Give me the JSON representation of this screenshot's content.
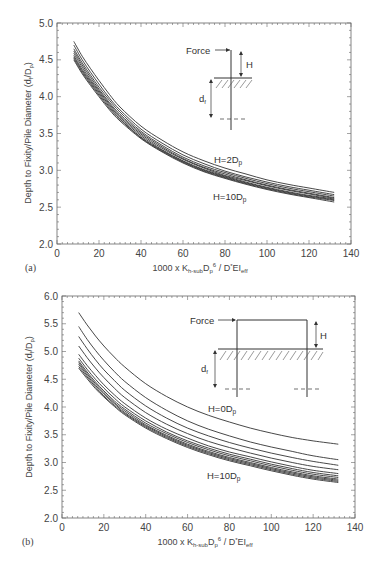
{
  "chart_data": [
    {
      "panel": "(a)",
      "type": "line",
      "title": "",
      "xlabel": "1000 x K_h-sub D_p^6 / D^* EI_eff",
      "ylabel": "Depth to Fixity/Pile Diameter (d_f/D_p)",
      "xlim": [
        0,
        140
      ],
      "ylim": [
        2.0,
        5.0
      ],
      "xticks": [
        0,
        20,
        40,
        60,
        80,
        100,
        120,
        140
      ],
      "yticks": [
        2.0,
        2.5,
        3.0,
        3.5,
        4.0,
        4.5,
        5.0
      ],
      "grid": false,
      "x": [
        8,
        12,
        16,
        20,
        25,
        30,
        40,
        50,
        60,
        70,
        80,
        90,
        100,
        110,
        120,
        132
      ],
      "series": [
        {
          "name": "H=2Dp",
          "values": [
            4.75,
            4.55,
            4.38,
            4.22,
            4.03,
            3.86,
            3.6,
            3.41,
            3.25,
            3.13,
            3.03,
            2.95,
            2.87,
            2.81,
            2.76,
            2.7
          ]
        },
        {
          "name": "H=3Dp",
          "values": [
            4.7,
            4.5,
            4.33,
            4.17,
            3.98,
            3.82,
            3.56,
            3.37,
            3.21,
            3.09,
            2.99,
            2.91,
            2.84,
            2.78,
            2.73,
            2.67
          ]
        },
        {
          "name": "H=4Dp",
          "values": [
            4.65,
            4.46,
            4.29,
            4.13,
            3.95,
            3.79,
            3.53,
            3.34,
            3.18,
            3.06,
            2.97,
            2.89,
            2.82,
            2.76,
            2.71,
            2.65
          ]
        },
        {
          "name": "H=5Dp",
          "values": [
            4.62,
            4.43,
            4.26,
            4.1,
            3.92,
            3.76,
            3.51,
            3.32,
            3.16,
            3.04,
            2.95,
            2.87,
            2.8,
            2.74,
            2.69,
            2.63
          ]
        },
        {
          "name": "H=6Dp",
          "values": [
            4.59,
            4.4,
            4.23,
            4.08,
            3.9,
            3.74,
            3.49,
            3.3,
            3.15,
            3.03,
            2.93,
            2.86,
            2.79,
            2.73,
            2.68,
            2.62
          ]
        },
        {
          "name": "H=7Dp",
          "values": [
            4.56,
            4.37,
            4.21,
            4.06,
            3.88,
            3.72,
            3.47,
            3.28,
            3.13,
            3.01,
            2.92,
            2.84,
            2.77,
            2.71,
            2.66,
            2.61
          ]
        },
        {
          "name": "H=8Dp",
          "values": [
            4.54,
            4.35,
            4.19,
            4.04,
            3.86,
            3.7,
            3.45,
            3.27,
            3.12,
            3.0,
            2.91,
            2.83,
            2.76,
            2.7,
            2.65,
            2.6
          ]
        },
        {
          "name": "H=9Dp",
          "values": [
            4.52,
            4.33,
            4.17,
            4.02,
            3.84,
            3.69,
            3.44,
            3.26,
            3.11,
            2.99,
            2.9,
            2.82,
            2.75,
            2.69,
            2.64,
            2.59
          ]
        },
        {
          "name": "H=10Dp",
          "values": [
            4.5,
            4.31,
            4.15,
            4.0,
            3.82,
            3.67,
            3.43,
            3.25,
            3.1,
            2.98,
            2.89,
            2.81,
            2.74,
            2.68,
            2.63,
            2.57
          ]
        }
      ],
      "annotations": [
        "H=2Dp",
        "H=10Dp",
        "Force",
        "H",
        "d_f"
      ]
    },
    {
      "panel": "(b)",
      "type": "line",
      "title": "",
      "xlabel": "1000 x K_h-sub D_p^6 / D^* EI_eff",
      "ylabel": "Depth to Fixity/Pile Diameter (d_f/D_p)",
      "xlim": [
        0,
        140
      ],
      "ylim": [
        2.0,
        6.0
      ],
      "xticks": [
        0,
        20,
        40,
        60,
        80,
        100,
        120,
        140
      ],
      "yticks": [
        2.0,
        2.5,
        3.0,
        3.5,
        4.0,
        4.5,
        5.0,
        5.5,
        6.0
      ],
      "grid": false,
      "x": [
        8,
        12,
        16,
        20,
        25,
        30,
        40,
        50,
        60,
        70,
        80,
        90,
        100,
        110,
        120,
        132
      ],
      "series": [
        {
          "name": "H=0Dp",
          "values": [
            5.7,
            5.48,
            5.28,
            5.1,
            4.9,
            4.72,
            4.42,
            4.19,
            4.0,
            3.85,
            3.73,
            3.62,
            3.53,
            3.45,
            3.39,
            3.33
          ]
        },
        {
          "name": "H=1Dp",
          "values": [
            5.45,
            5.22,
            5.02,
            4.84,
            4.64,
            4.46,
            4.17,
            3.94,
            3.75,
            3.6,
            3.48,
            3.37,
            3.28,
            3.2,
            3.12,
            3.05
          ]
        },
        {
          "name": "H=2Dp",
          "values": [
            5.27,
            5.05,
            4.85,
            4.67,
            4.48,
            4.3,
            4.02,
            3.8,
            3.62,
            3.48,
            3.36,
            3.26,
            3.17,
            3.09,
            3.02,
            2.95
          ]
        },
        {
          "name": "H=3Dp",
          "values": [
            5.1,
            4.89,
            4.7,
            4.53,
            4.34,
            4.17,
            3.9,
            3.69,
            3.52,
            3.38,
            3.27,
            3.17,
            3.08,
            3.0,
            2.93,
            2.87
          ]
        },
        {
          "name": "H=4Dp",
          "values": [
            4.95,
            4.75,
            4.57,
            4.4,
            4.22,
            4.06,
            3.8,
            3.6,
            3.44,
            3.3,
            3.19,
            3.1,
            3.01,
            2.93,
            2.86,
            2.8
          ]
        },
        {
          "name": "H=5Dp",
          "values": [
            4.88,
            4.68,
            4.5,
            4.34,
            4.16,
            4.0,
            3.75,
            3.55,
            3.39,
            3.26,
            3.15,
            3.06,
            2.97,
            2.89,
            2.82,
            2.76
          ]
        },
        {
          "name": "H=6Dp",
          "values": [
            4.83,
            4.63,
            4.45,
            4.29,
            4.11,
            3.96,
            3.71,
            3.52,
            3.36,
            3.23,
            3.12,
            3.03,
            2.94,
            2.86,
            2.79,
            2.73
          ]
        },
        {
          "name": "H=7Dp",
          "values": [
            4.8,
            4.6,
            4.42,
            4.26,
            4.08,
            3.93,
            3.68,
            3.49,
            3.33,
            3.2,
            3.09,
            3.0,
            2.91,
            2.83,
            2.76,
            2.7
          ]
        },
        {
          "name": "H=8Dp",
          "values": [
            4.77,
            4.57,
            4.39,
            4.23,
            4.06,
            3.9,
            3.66,
            3.47,
            3.31,
            3.18,
            3.07,
            2.98,
            2.89,
            2.81,
            2.74,
            2.68
          ]
        },
        {
          "name": "H=9Dp",
          "values": [
            4.73,
            4.54,
            4.36,
            4.2,
            4.03,
            3.88,
            3.64,
            3.45,
            3.29,
            3.16,
            3.05,
            2.96,
            2.87,
            2.79,
            2.72,
            2.66
          ]
        },
        {
          "name": "H=10Dp",
          "values": [
            4.7,
            4.51,
            4.33,
            4.18,
            4.01,
            3.86,
            3.62,
            3.43,
            3.27,
            3.14,
            3.03,
            2.94,
            2.85,
            2.77,
            2.7,
            2.64
          ]
        }
      ],
      "annotations": [
        "H=0Dp",
        "H=10Dp",
        "Force",
        "H",
        "d_f"
      ]
    }
  ],
  "panels": {
    "a": {
      "label": "(a)",
      "ylabel": "Depth to Fixity/Pile Diameter (d",
      "ylabel_sub1": "f",
      "ylabel_mid": "/D",
      "ylabel_sub2": "p",
      "ylabel_end": ")",
      "xlabel_pre": "1000 x K",
      "xlabel_sub1": "h-sub",
      "xlabel_mid": "D",
      "xlabel_sub2": "p",
      "xlabel_sup": "6",
      "xlabel_mid2": " / D",
      "xlabel_sup2": "*",
      "xlabel_mid3": "EI",
      "xlabel_sub3": "eff",
      "top_label": "H=2D",
      "top_label_sub": "p",
      "bottom_label": "H=10D",
      "bottom_label_sub": "p",
      "inset": {
        "force": "Force",
        "h": "H",
        "df": "d",
        "df_sub": "f"
      }
    },
    "b": {
      "label": "(b)",
      "top_label": "H=0D",
      "top_label_sub": "p",
      "bottom_label": "H=10D",
      "bottom_label_sub": "p",
      "inset": {
        "force": "Force",
        "h": "H",
        "df": "d",
        "df_sub": "f"
      }
    }
  },
  "colors": {
    "curve": "#333333",
    "axis": "#666666",
    "text": "#444444"
  }
}
